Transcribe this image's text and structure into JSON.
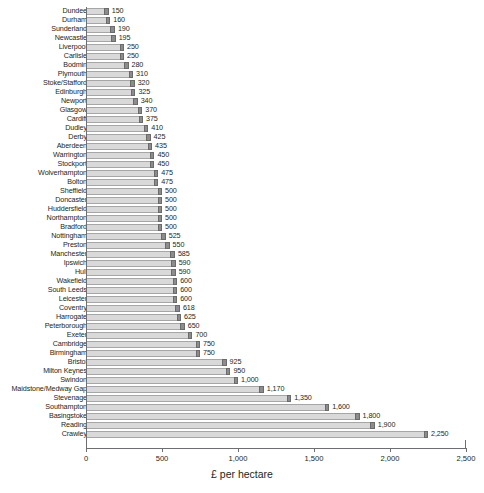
{
  "chart_data": {
    "type": "bar",
    "orientation": "horizontal",
    "title": "",
    "subtitle": "",
    "xlabel": "£ per hectare",
    "ylabel": "",
    "xlim": [
      0,
      2500
    ],
    "xticks": [
      0,
      500,
      1000,
      1500,
      2000,
      2500
    ],
    "xtick_labels": [
      "0",
      "500",
      "1,000",
      "1,500",
      "2,000",
      "2,500"
    ],
    "grid": false,
    "legend": null,
    "bar_color": "#d9d9d9",
    "bar_cap_color": "#8c8c8c",
    "axis_color": "#6d6e71",
    "text_color": "#231f20",
    "categories": [
      "Dundee",
      "Durham",
      "Sunderland",
      "Newcastle",
      "Liverpool",
      "Carlisle",
      "Bodmin",
      "Plymouth",
      "Stoke/Stafford",
      "Edinburgh",
      "Newport",
      "Glasgow",
      "Cardiff",
      "Dudley",
      "Derby",
      "Aberdeen",
      "Warrington",
      "Stockport",
      "Wolverhampton",
      "Bolton",
      "Sheffield",
      "Doncaster",
      "Huddersfield",
      "Northampton",
      "Bradford",
      "Nottingham",
      "Preston",
      "Manchester",
      "Ipswich",
      "Hull",
      "Wakefield",
      "South Leeds",
      "Leicester",
      "Coventry",
      "Harrogate",
      "Peterborough",
      "Exeter",
      "Cambridge",
      "Birmingham",
      "Bristol",
      "Milton Keynes",
      "Swindon",
      "Maidstone/Medway Gap",
      "Stevenage",
      "Southampton",
      "Basingstoke",
      "Reading",
      "Crawley"
    ],
    "values": [
      150,
      160,
      190,
      195,
      250,
      250,
      280,
      310,
      320,
      325,
      340,
      370,
      375,
      410,
      425,
      435,
      450,
      450,
      475,
      475,
      500,
      500,
      500,
      500,
      500,
      525,
      550,
      585,
      590,
      590,
      600,
      600,
      600,
      618,
      625,
      650,
      700,
      750,
      750,
      925,
      950,
      1000,
      1170,
      1350,
      1600,
      1800,
      1900,
      2250
    ],
    "value_labels": [
      "150",
      "160",
      "190",
      "195",
      "250",
      "250",
      "280",
      "310",
      "320",
      "325",
      "340",
      "370",
      "375",
      "410",
      "425",
      "435",
      "450",
      "450",
      "475",
      "475",
      "500",
      "500",
      "500",
      "500",
      "500",
      "525",
      "550",
      "585",
      "590",
      "590",
      "600",
      "600",
      "600",
      "618",
      "625",
      "650",
      "700",
      "750",
      "750",
      "925",
      "950",
      "1,000",
      "1,170",
      "1,350",
      "1,600",
      "1,800",
      "1,900",
      "2,250"
    ]
  }
}
